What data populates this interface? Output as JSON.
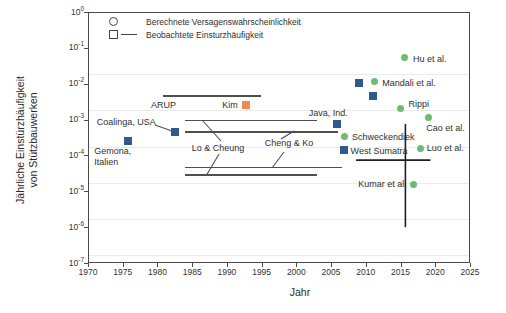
{
  "page": {
    "background": "#ffffff"
  },
  "chart_data": {
    "type": "scatter",
    "title": "",
    "xlabel": "Jahr",
    "ylabel_lines": [
      "Jährliche Einstürzhäufigkeit",
      "von Stützbauwerken"
    ],
    "x_axis": {
      "min": 1970,
      "max": 2025,
      "ticks": [
        1970,
        1975,
        1980,
        1985,
        1990,
        1995,
        2000,
        2005,
        2010,
        2015,
        2020,
        2025
      ]
    },
    "y_axis": {
      "scale": "log",
      "tick_exponents": [
        0,
        -1,
        -2,
        -3,
        -4,
        -5,
        -6,
        -7
      ],
      "min": 1e-07,
      "max": 1
    },
    "legend": {
      "items": [
        {
          "symbol": "circle-outline",
          "label": "Berechnete Versagenswahrscheinlichkeit"
        },
        {
          "symbol": "square-outline-dash",
          "label": "Beobachtete Einsturzhäufigkeit"
        }
      ]
    },
    "colors": {
      "computed_marker": "#6dbd70",
      "observed_marker": "#2e5b8f",
      "kim_marker": "#ef8a54",
      "axis": "#4a4a4a",
      "annotation_line": "#4f4f4f",
      "error_bar": "#1f1f1f",
      "text": "#2f2f2f"
    },
    "series": [
      {
        "name": "Beobachtete Einsturzhäufigkeit",
        "marker": "square",
        "color_key": "observed_marker",
        "points": [
          {
            "year": 1975.8,
            "value": 0.00026,
            "label": "Gemona,\nItalien",
            "label_dx": -34,
            "label_dy": 16,
            "label_align": "left"
          },
          {
            "year": 1982.5,
            "value": 0.00044,
            "label": "Coalinga, USA",
            "label_dx": -78,
            "label_dy": -10,
            "label_align": "left"
          },
          {
            "year": 2005.9,
            "value": 0.00076,
            "label": "Java, Ind.",
            "label_dx": -9,
            "label_dy": -11,
            "label_align": "center"
          },
          {
            "year": 2006.8,
            "value": 0.000145,
            "label": "West Sumatra",
            "label_dx": 7,
            "label_dy": 1,
            "label_align": "left"
          },
          {
            "year": 2009.0,
            "value": 0.0105,
            "label": "",
            "label_dx": 0,
            "label_dy": 0,
            "label_align": "left"
          },
          {
            "year": 2011.0,
            "value": 0.0044,
            "label": "",
            "label_dx": 0,
            "label_dy": 0,
            "label_align": "left"
          }
        ]
      },
      {
        "name": "Berechnete Versagenswahrscheinlichkeit",
        "marker": "circle",
        "color_key": "computed_marker",
        "points": [
          {
            "year": 2011.2,
            "value": 0.0115,
            "label": "Mandali et al.",
            "label_dx": 8,
            "label_dy": 1,
            "label_align": "left"
          },
          {
            "year": 2015.5,
            "value": 0.053,
            "label": "Hu et al.",
            "label_dx": 9,
            "label_dy": 1,
            "label_align": "left"
          },
          {
            "year": 2015.0,
            "value": 0.0021,
            "label": "Rippi",
            "label_dx": 8,
            "label_dy": -4,
            "label_align": "left"
          },
          {
            "year": 2019.0,
            "value": 0.00115,
            "label": "Cao et al.",
            "label_dx": -2,
            "label_dy": 11,
            "label_align": "left"
          },
          {
            "year": 2007.0,
            "value": 0.000335,
            "label": "Schweckendiek",
            "label_dx": 7,
            "label_dy": 0,
            "label_align": "left"
          },
          {
            "year": 2017.9,
            "value": 0.00016,
            "label": "Luo et al.",
            "label_dx": 6,
            "label_dy": 0,
            "label_align": "left"
          },
          {
            "year": 2016.9,
            "value": 1.55e-05,
            "label": "Kumar et al.",
            "label_dx": -7,
            "label_dy": 0,
            "label_align": "right"
          }
        ]
      },
      {
        "name": "Kim",
        "marker": "square",
        "color_key": "kim_marker",
        "points": [
          {
            "year": 1992.7,
            "value": 0.0026,
            "label": "Kim",
            "label_dx": -8,
            "label_dy": 0,
            "label_align": "right"
          }
        ]
      }
    ],
    "range_lines": [
      {
        "name": "ARUP",
        "value": 0.0047,
        "year_from": 1980.8,
        "year_to": 1994.9
      },
      {
        "name": "Lo & Cheung upper",
        "value": 0.001,
        "year_from": 1984.0,
        "year_to": 2003.0
      },
      {
        "name": "Cheng & Ko upper",
        "value": 0.00047,
        "year_from": 1984.0,
        "year_to": 2006.0
      },
      {
        "name": "Cheng & Ko lower",
        "value": 4.8e-05,
        "year_from": 1984.0,
        "year_to": 2006.5
      },
      {
        "name": "Lo & Cheung lower",
        "value": 3e-05,
        "year_from": 1984.0,
        "year_to": 2003.0
      }
    ],
    "error_bar": {
      "year": 2015.7,
      "value_top": 0.00076,
      "value_bottom": 1e-06,
      "horizontal": {
        "value": 7.4e-05,
        "year_from": 2008.6,
        "year_to": 2019.3
      }
    },
    "annotations": {
      "labels": [
        {
          "text": "ARUP",
          "x": 151,
          "y": 105,
          "align": "left"
        },
        {
          "text": "Lo & Cheung",
          "x": 218,
          "y": 148,
          "align": "center"
        },
        {
          "text": "Cheng & Ko",
          "x": 289,
          "y": 143,
          "align": "center"
        }
      ],
      "leader_segments": [
        [
          155,
          125,
          172,
          131
        ],
        [
          203,
          121,
          221,
          141
        ],
        [
          206,
          176,
          219,
          154
        ],
        [
          281,
          139,
          294,
          131
        ],
        [
          272,
          168,
          284,
          152
        ]
      ]
    }
  },
  "layout": {
    "plot": {
      "left": 88,
      "top": 12,
      "width": 382,
      "height": 251
    },
    "scanlines": [
      74,
      110,
      147,
      183,
      219,
      255
    ],
    "legend_pos": {
      "left": 108,
      "top": 15
    },
    "x_title_center": 300
  }
}
